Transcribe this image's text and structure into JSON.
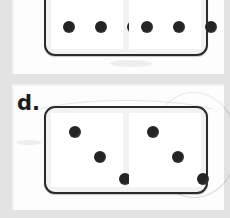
{
  "worksheet": {
    "background_color": "#e3e3e3",
    "panel_color": "#fdfdfd",
    "pip_color": "#242424",
    "tile_border_color": "#2b2b2b"
  },
  "panels": [
    {
      "name": "panel-top",
      "label": "",
      "clipped": "top"
    },
    {
      "name": "panel-bottom",
      "label": "d."
    }
  ],
  "dominoes": [
    {
      "id": "domino-top",
      "clipped": "top",
      "left_half": {
        "pip_count": 6,
        "pips": [
          {
            "x": 18,
            "y": 4
          },
          {
            "x": 50,
            "y": 4
          },
          {
            "x": 82,
            "y": 4
          },
          {
            "x": 18,
            "y": 70
          },
          {
            "x": 50,
            "y": 70
          },
          {
            "x": 82,
            "y": 70
          }
        ]
      },
      "right_half": {
        "pip_count": 7,
        "pips": [
          {
            "x": 18,
            "y": 4
          },
          {
            "x": 50,
            "y": 4
          },
          {
            "x": 82,
            "y": 4
          },
          {
            "x": 50,
            "y": 37
          },
          {
            "x": 18,
            "y": 70
          },
          {
            "x": 50,
            "y": 70
          },
          {
            "x": 82,
            "y": 70
          }
        ]
      }
    },
    {
      "id": "domino-bottom",
      "clipped": "none",
      "left_half": {
        "pip_count": 3,
        "pips": [
          {
            "x": 24,
            "y": 19
          },
          {
            "x": 49,
            "y": 44
          },
          {
            "x": 74,
            "y": 66
          }
        ]
      },
      "right_half": {
        "pip_count": 3,
        "pips": [
          {
            "x": 24,
            "y": 19
          },
          {
            "x": 49,
            "y": 44
          },
          {
            "x": 74,
            "y": 66
          }
        ]
      }
    }
  ]
}
